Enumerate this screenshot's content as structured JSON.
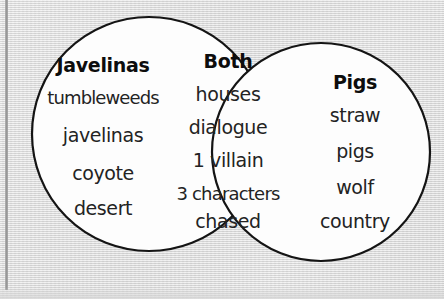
{
  "diagram": {
    "type": "venn-2-set",
    "background_color": "#dedede",
    "circle_fill": "#fdfdfd",
    "stroke_color": "#141414",
    "left_set": {
      "heading": "Javelinas",
      "items": [
        "tumbleweeds",
        "javelinas",
        "coyote",
        "desert"
      ]
    },
    "overlap_set": {
      "heading": "Both",
      "items": [
        "houses",
        "dialogue",
        "1 villain",
        "3 characters",
        "chased"
      ]
    },
    "right_set": {
      "heading": "Pigs",
      "items": [
        "straw",
        "pigs",
        "wolf",
        "country"
      ]
    }
  }
}
